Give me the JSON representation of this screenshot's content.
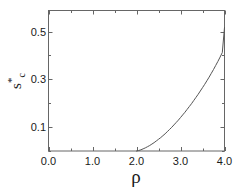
{
  "chart_data": {
    "type": "line",
    "title": "",
    "xlabel": "ρ",
    "ylabel": "s*c",
    "ylabel_base": "s",
    "ylabel_sup": "*",
    "ylabel_sub": "c",
    "xlim": [
      0.0,
      4.0
    ],
    "ylim": [
      0.0,
      0.588
    ],
    "grid": false,
    "legend": null,
    "xticks": [
      0.0,
      1.0,
      2.0,
      3.0,
      4.0
    ],
    "xtick_labels": [
      "0.0",
      "1.0",
      "2.0",
      "3.0",
      "4.0"
    ],
    "xminor_ticks": [
      0.5,
      1.5,
      2.5,
      3.5
    ],
    "yticks": [
      0.1,
      0.3,
      0.5
    ],
    "ytick_labels": [
      "0.1",
      "0.3",
      "0.5"
    ],
    "yminor_ticks": [
      0.0,
      0.2,
      0.4
    ],
    "series": [
      {
        "name": "critical stress",
        "color": "#555555",
        "linewidth": 1.0,
        "x": [
          2.0,
          2.05,
          2.1,
          2.15,
          2.2,
          2.25,
          2.3,
          2.35,
          2.4,
          2.45,
          2.5,
          2.55,
          2.6,
          2.65,
          2.7,
          2.75,
          2.8,
          2.85,
          2.9,
          2.95,
          3.0,
          3.05,
          3.1,
          3.15,
          3.2,
          3.25,
          3.3,
          3.35,
          3.4,
          3.45,
          3.5,
          3.55,
          3.6,
          3.65,
          3.7,
          3.75,
          3.8,
          3.85,
          3.9,
          3.95,
          4.0
        ],
        "y": [
          0.0,
          0.002,
          0.005,
          0.009,
          0.013,
          0.018,
          0.023,
          0.029,
          0.035,
          0.042,
          0.049,
          0.056,
          0.064,
          0.072,
          0.081,
          0.09,
          0.099,
          0.109,
          0.119,
          0.129,
          0.14,
          0.151,
          0.162,
          0.174,
          0.186,
          0.198,
          0.211,
          0.224,
          0.237,
          0.251,
          0.265,
          0.279,
          0.294,
          0.309,
          0.325,
          0.341,
          0.358,
          0.375,
          0.393,
          0.412,
          0.517
        ]
      }
    ],
    "annotations": [
      {
        "text": "onset at ρ = 2.0",
        "visible": false
      }
    ]
  },
  "axes": {
    "frame_color": "#666666",
    "tick_color": "#666666",
    "text_color": "#1a1a1a",
    "background": "#ffffff"
  }
}
